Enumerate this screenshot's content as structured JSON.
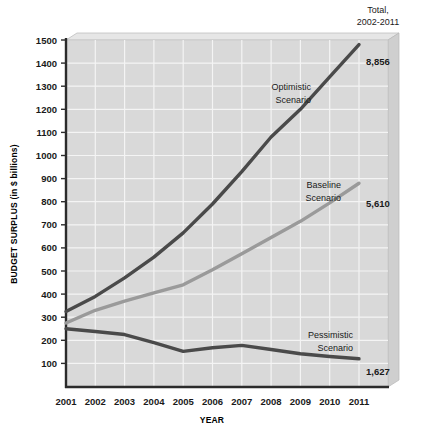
{
  "chart_data": {
    "type": "line",
    "title": "",
    "xlabel": "YEAR",
    "ylabel": "BUDGET SURPLUS (in $ billions)",
    "x": [
      2001,
      2002,
      2003,
      2004,
      2005,
      2006,
      2007,
      2008,
      2009,
      2010,
      2011
    ],
    "xticklabels": [
      "2001",
      "2002",
      "2003",
      "2004",
      "2005",
      "2006",
      "2007",
      "2008",
      "2009",
      "2010",
      "2011"
    ],
    "yticklabels": [
      "1500",
      "1400",
      "1300",
      "1200",
      "1100",
      "1000",
      "900",
      "800",
      "700",
      "600",
      "500",
      "400",
      "300",
      "200",
      "100"
    ],
    "yticks": [
      1500,
      1400,
      1300,
      1200,
      1100,
      1000,
      900,
      800,
      700,
      600,
      500,
      400,
      300,
      200,
      100
    ],
    "ylim": [
      0,
      1500
    ],
    "xlim": [
      2001,
      2011
    ],
    "grid": true,
    "legend_position": "inline-annotations",
    "series": [
      {
        "name": "Optimistic Scenario",
        "label": "Optimistic\nScenario",
        "label_line1": "Optimistic",
        "label_line2": "Scenario",
        "color": "#4a4a4a",
        "values": [
          325,
          390,
          470,
          560,
          665,
          790,
          930,
          1080,
          1200,
          1340,
          1480
        ],
        "total": "8,856"
      },
      {
        "name": "Baseline Scenario",
        "label_line1": "Baseline",
        "label_line2": "Scenario",
        "color": "#9a9a9a",
        "values": [
          275,
          330,
          370,
          405,
          440,
          505,
          575,
          645,
          715,
          795,
          880
        ],
        "total": "5,610"
      },
      {
        "name": "Pessimistic Scenario",
        "label_line1": "Pessimistic",
        "label_line2": "Scenario",
        "color": "#4a4a4a",
        "values": [
          250,
          238,
          225,
          190,
          152,
          168,
          178,
          160,
          142,
          130,
          120
        ],
        "total": "1,627"
      }
    ],
    "total_header_line1": "Total,",
    "total_header_line2": "2002-2011",
    "colors": {
      "plot_background": "#d9d9d9",
      "bevel_top": "#e4e4e4",
      "bevel_side": "#cccccc",
      "gridline": "#f2f2f2",
      "axis": "#2b2b2b",
      "dark_series": "#4a4a4a",
      "light_series": "#9a9a9a"
    }
  }
}
